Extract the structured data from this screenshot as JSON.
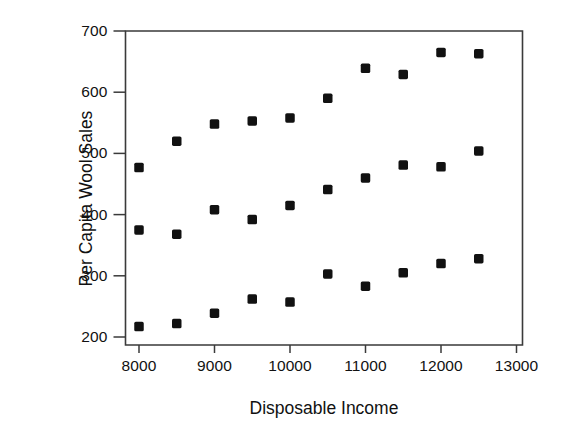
{
  "chart_data": {
    "type": "scatter",
    "title": "",
    "xlabel": "Disposable Income",
    "ylabel": "Per Capita Wool Sales",
    "xlim": [
      7800,
      13000
    ],
    "ylim": [
      195,
      706
    ],
    "grid": false,
    "legend": "none",
    "marker": "filled-square",
    "marker_color": "#111111",
    "x_ticks": [
      8000,
      9000,
      10000,
      11000,
      12000,
      13000
    ],
    "x_tick_labels": [
      "8000",
      "9000",
      "10000",
      "11000",
      "12000",
      "13000"
    ],
    "y_ticks": [
      200,
      300,
      400,
      500,
      600,
      700
    ],
    "y_tick_labels": [
      "200",
      "300",
      "400",
      "500",
      "600",
      "700"
    ],
    "x": [
      8000,
      8500,
      9000,
      9500,
      10000,
      10500,
      11000,
      11500,
      12000,
      12500
    ],
    "series": [
      {
        "name": "upper",
        "values": [
          477,
          520,
          548,
          553,
          558,
          590,
          639,
          629,
          665,
          663
        ]
      },
      {
        "name": "middle",
        "values": [
          375,
          368,
          408,
          392,
          415,
          441,
          460,
          481,
          478,
          504
        ]
      },
      {
        "name": "lower",
        "values": [
          217,
          222,
          239,
          262,
          257,
          303,
          283,
          305,
          320,
          328
        ]
      }
    ]
  },
  "axes": {
    "x_title": "Disposable Income",
    "y_title": "Per Capita Wool Sales"
  }
}
